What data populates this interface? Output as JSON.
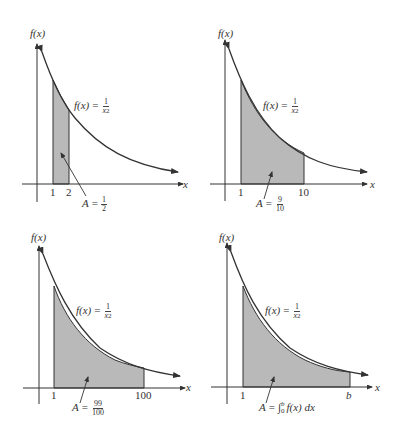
{
  "function_label": {
    "prefix": "f(x)",
    "equals": "=",
    "numerator": "1",
    "denominator_base": "x",
    "denominator_exp": "2"
  },
  "y_axis_label": "f(x)",
  "x_axis_label": "x",
  "panels": [
    {
      "id": "panel-1",
      "x_ticks": [
        "1",
        "2"
      ],
      "area_label": {
        "prefix": "A",
        "equals": "=",
        "numerator": "1",
        "denominator": "2"
      }
    },
    {
      "id": "panel-2",
      "x_ticks": [
        "1",
        "10"
      ],
      "area_label": {
        "prefix": "A",
        "equals": "=",
        "numerator": "9",
        "denominator": "10"
      }
    },
    {
      "id": "panel-3",
      "x_ticks": [
        "1",
        "100"
      ],
      "area_label": {
        "prefix": "A",
        "equals": "=",
        "numerator": "99",
        "denominator": "100"
      }
    },
    {
      "id": "panel-4",
      "x_ticks": [
        "1",
        "b"
      ],
      "area_label": {
        "prefix": "A",
        "equals": "=",
        "integral": "∫",
        "lower": "0",
        "upper": "b",
        "integrand": "f(x) dx"
      }
    }
  ],
  "colors": {
    "line": "#333333",
    "shade": "#b9b9b9",
    "background": "#ffffff"
  }
}
